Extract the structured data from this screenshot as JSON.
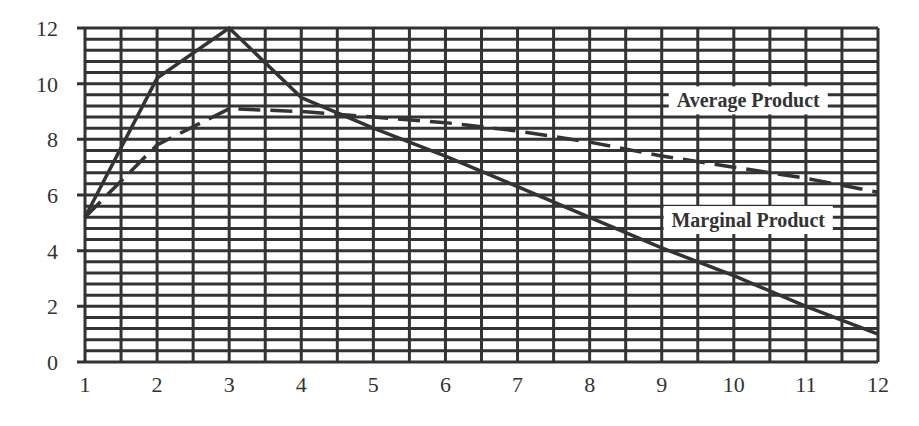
{
  "chart_data": {
    "type": "line",
    "title": "",
    "xlabel": "",
    "ylabel": "",
    "x": [
      1,
      2,
      3,
      4,
      5,
      6,
      7,
      8,
      9,
      10,
      11,
      12
    ],
    "xlim": [
      1,
      12
    ],
    "ylim": [
      0,
      12
    ],
    "xticks": [
      "1",
      "2",
      "3",
      "4",
      "5",
      "6",
      "7",
      "8",
      "9",
      "10",
      "11",
      "12"
    ],
    "yticks": [
      "0",
      "2",
      "4",
      "6",
      "8",
      "10",
      "12"
    ],
    "grid": {
      "on": true,
      "vertical_step": 0.5,
      "horizontal_step": 0.4
    },
    "legend": "inline labels on right side",
    "series": [
      {
        "name": "Marginal Product",
        "style": "solid",
        "values": [
          5.2,
          10.2,
          12.0,
          9.5,
          8.4,
          7.4,
          6.3,
          5.2,
          4.1,
          3.1,
          2.0,
          1.0
        ]
      },
      {
        "name": "Average Product",
        "style": "dashed",
        "values": [
          5.2,
          7.8,
          9.1,
          9.0,
          8.8,
          8.6,
          8.3,
          7.9,
          7.4,
          7.0,
          6.6,
          6.1
        ]
      }
    ],
    "annotations": [
      {
        "text": "Average Product",
        "x": 10.2,
        "y": 9.4
      },
      {
        "text": "Marginal Product",
        "x": 10.2,
        "y": 5.1
      }
    ]
  },
  "colors": {
    "line": "#333333",
    "grid": "#333333",
    "background": "#ffffff"
  }
}
